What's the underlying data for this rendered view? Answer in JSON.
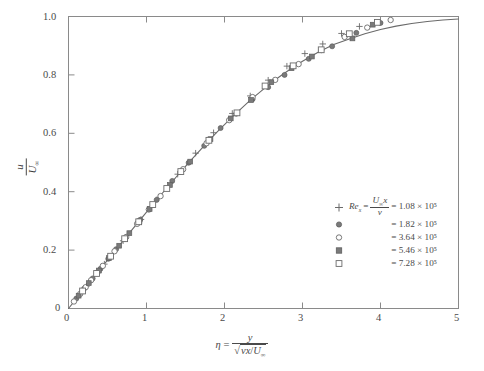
{
  "figure": {
    "kind": "blasius-boundary-layer-velocity-profile",
    "background_color": "#ffffff",
    "frame_color": "#8a8a8a",
    "curve_color": "#6a6a6a",
    "marker_color": "#6a6a6a",
    "text_color": "#4a4a4a"
  },
  "axes": {
    "x": {
      "label_parts": {
        "eta": "η",
        "equals": "=",
        "numerator": "y",
        "denominator_radicand_nu": "ν",
        "denominator_radicand_x": "x",
        "denominator_slash": "/",
        "denominator_U": "U",
        "denominator_U_sub": "∞"
      },
      "ticks": [
        "0",
        "1",
        "2",
        "3",
        "4",
        "5"
      ],
      "tick_values": [
        0,
        1,
        2,
        3,
        4,
        5
      ],
      "range": [
        0,
        5
      ]
    },
    "y": {
      "label_parts": {
        "numerator": "u",
        "denominator_U": "U",
        "denominator_U_sub": "∞"
      },
      "ticks": [
        "0",
        "0.2",
        "0.4",
        "0.6",
        "0.8",
        "1.0"
      ],
      "tick_values": [
        0,
        0.2,
        0.4,
        0.6,
        0.8,
        1.0
      ],
      "range": [
        0,
        1.0
      ]
    }
  },
  "legend": {
    "header_symbol": "Re",
    "header_symbol_sub": "x",
    "header_equals": "=",
    "header_fraction_num_U": "U",
    "header_fraction_num_U_sub": "∞",
    "header_fraction_num_x": "x",
    "header_fraction_den": "ν",
    "entries": [
      {
        "marker": "plus",
        "value_text": "= 1.08 × 10⁵",
        "mantissa": 1.08,
        "exponent": 5
      },
      {
        "marker": "filled-circle",
        "value_text": "= 1.82 × 10⁵",
        "mantissa": 1.82,
        "exponent": 5
      },
      {
        "marker": "open-circle",
        "value_text": "= 3.64 × 10⁵",
        "mantissa": 3.64,
        "exponent": 5
      },
      {
        "marker": "filled-square",
        "value_text": "= 5.46 × 10⁵",
        "mantissa": 5.46,
        "exponent": 5
      },
      {
        "marker": "open-square",
        "value_text": "= 7.28 × 10⁵",
        "mantissa": 7.28,
        "exponent": 5
      }
    ]
  },
  "chart_data": {
    "type": "scatter",
    "title": "",
    "xlabel": "eta = y / sqrt(nu*x/U_inf)",
    "ylabel": "u / U_inf",
    "xlim": [
      0,
      5
    ],
    "ylim": [
      0,
      1.0
    ],
    "grid": false,
    "legend_position": "inside-lower-right",
    "curve": {
      "name": "Blasius solution",
      "x": [
        0,
        0.1,
        0.2,
        0.3,
        0.4,
        0.5,
        0.6,
        0.7,
        0.8,
        0.9,
        1.0,
        1.1,
        1.2,
        1.3,
        1.4,
        1.5,
        1.6,
        1.7,
        1.8,
        1.9,
        2.0,
        2.1,
        2.2,
        2.3,
        2.4,
        2.5,
        2.6,
        2.7,
        2.8,
        2.9,
        3.0,
        3.2,
        3.4,
        3.6,
        3.8,
        4.0,
        4.2,
        4.4,
        4.6,
        4.8,
        5.0
      ],
      "y": [
        0,
        0.0332,
        0.0664,
        0.0996,
        0.1328,
        0.1659,
        0.1989,
        0.2319,
        0.2647,
        0.2974,
        0.3298,
        0.362,
        0.3938,
        0.4252,
        0.4563,
        0.4868,
        0.5168,
        0.5462,
        0.5748,
        0.6028,
        0.6298,
        0.656,
        0.6813,
        0.7056,
        0.729,
        0.7513,
        0.7725,
        0.7927,
        0.8117,
        0.8297,
        0.8467,
        0.8775,
        0.9043,
        0.9233,
        0.9411,
        0.9555,
        0.967,
        0.9759,
        0.9827,
        0.9878,
        0.9916
      ]
    },
    "series": [
      {
        "name": "Re_x = 1.08e5",
        "marker": "plus",
        "x": [
          0.23,
          0.46,
          0.7,
          0.93,
          1.16,
          1.4,
          1.63,
          1.86,
          2.1,
          2.33,
          2.56,
          2.8,
          3.03,
          3.26,
          3.5,
          3.73
        ],
        "y": [
          0.076,
          0.152,
          0.232,
          0.305,
          0.381,
          0.46,
          0.532,
          0.602,
          0.668,
          0.728,
          0.782,
          0.83,
          0.873,
          0.906,
          0.942,
          0.966
        ]
      },
      {
        "name": "Re_x = 1.82e5",
        "marker": "filled-circle",
        "x": [
          0.1,
          0.2,
          0.31,
          0.41,
          0.51,
          0.61,
          0.72,
          0.92,
          1.13,
          1.33,
          1.54,
          1.74,
          1.95,
          2.15,
          2.36,
          2.56,
          2.77,
          3.08,
          3.38,
          3.69,
          4.0
        ],
        "y": [
          0.034,
          0.068,
          0.103,
          0.136,
          0.17,
          0.203,
          0.238,
          0.304,
          0.372,
          0.437,
          0.499,
          0.557,
          0.618,
          0.667,
          0.717,
          0.758,
          0.8,
          0.855,
          0.898,
          0.944,
          0.978
        ]
      },
      {
        "name": "Re_x = 3.64e5",
        "marker": "open-circle",
        "x": [
          0.07,
          0.15,
          0.22,
          0.29,
          0.37,
          0.44,
          0.59,
          0.74,
          0.88,
          1.03,
          1.18,
          1.47,
          1.77,
          2.06,
          2.36,
          2.65,
          2.95,
          3.24,
          3.54,
          3.83,
          4.13
        ],
        "y": [
          0.024,
          0.05,
          0.073,
          0.097,
          0.123,
          0.146,
          0.196,
          0.245,
          0.29,
          0.339,
          0.385,
          0.477,
          0.566,
          0.645,
          0.724,
          0.783,
          0.837,
          0.885,
          0.93,
          0.962,
          0.988
        ]
      },
      {
        "name": "Re_x = 5.46e5",
        "marker": "filled-square",
        "x": [
          0.13,
          0.26,
          0.39,
          0.52,
          0.65,
          0.78,
          0.91,
          1.04,
          1.3,
          1.56,
          1.82,
          2.08,
          2.34,
          2.6,
          2.86,
          3.12,
          3.64,
          3.9
        ],
        "y": [
          0.044,
          0.087,
          0.13,
          0.173,
          0.215,
          0.258,
          0.299,
          0.341,
          0.423,
          0.503,
          0.58,
          0.651,
          0.714,
          0.775,
          0.823,
          0.863,
          0.925,
          0.972
        ]
      },
      {
        "name": "Re_x = 7.28e5",
        "marker": "open-square",
        "x": [
          0.18,
          0.36,
          0.54,
          0.72,
          0.9,
          1.08,
          1.26,
          1.44,
          1.8,
          2.16,
          2.52,
          2.88,
          3.24,
          3.6,
          3.96
        ],
        "y": [
          0.06,
          0.12,
          0.179,
          0.239,
          0.297,
          0.356,
          0.411,
          0.469,
          0.576,
          0.67,
          0.762,
          0.831,
          0.886,
          0.941,
          0.98
        ]
      }
    ]
  }
}
